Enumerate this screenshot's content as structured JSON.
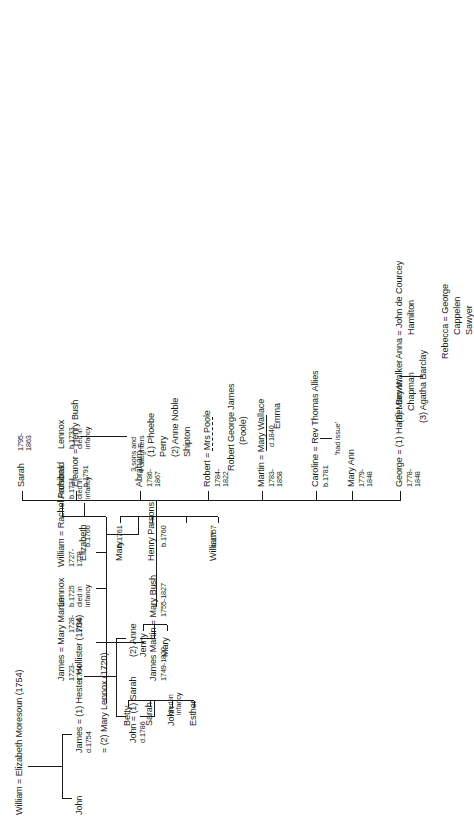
{
  "diagram": {
    "type": "genealogy-family-tree",
    "orientation": "rotated-90-ccw",
    "root": "William = Elizabeth Moresoun (1754)"
  },
  "gen1": {
    "couple": "William = Elizabeth Moresoun (1754)"
  },
  "gen2": {
    "john": "John",
    "james_name": "James = (1) Hester Hollister (1704)",
    "james_dates": "d.1754",
    "james_m2": "= (2) Mary Lennox (1720)"
  },
  "gen3_hester": {
    "john_name": "John = (1) Sarah",
    "john_dates": "d.1786",
    "anne": "(2) Anne",
    "anne_children": [
      "Mary",
      "Jenny"
    ],
    "john_children": [
      "Esther",
      "John",
      "Sarah",
      "Betty"
    ],
    "john_infancy": "died in\ninfancy"
  },
  "gen3_lennox": {
    "james_name": "James = Mary Martin",
    "james_dates": "1723-\n1764",
    "mary_martin_dates": "1728-\n1796",
    "lennox": "Lennox",
    "lennox_dates": "b.1725\ndied in\ninfancy",
    "william_name": "William = Rachel Parsons",
    "william_dates": "1727-\n1778",
    "archibald": "Archibald",
    "archibald_dates": "b.1731\ndied in\ninfancy",
    "lennox2": "Lennox",
    "lennox2_dates": "b.1733\ndied in\ninfancy"
  },
  "gen4_william": {
    "children": [
      {
        "name": "William",
        "dates": "b.1757"
      },
      {
        "name": "Henry Parsons",
        "dates": "b.1760"
      },
      {
        "name": "Mary",
        "dates": "b.1761"
      },
      {
        "name": "Elizabeth",
        "dates": "b.1766"
      }
    ]
  },
  "gen4_james": {
    "name": "James Martin = Mary Bush",
    "dates_husband": "1749-1822",
    "dates_wife": "1755-1827"
  },
  "gen5": {
    "george": {
      "name": "George = (1) Harriet Brown",
      "m2": "(2) Mary Walker",
      "m2b": "Chapman",
      "m3": "(3) Agatha Barclay",
      "dates": "1778-\n1848"
    },
    "mary_ann": {
      "name": "Mary Ann",
      "dates": "1779-\n1848"
    },
    "caroline": {
      "name": "Caroline = Rev Thomas Allies",
      "dates": "b.1781",
      "issue": "'had issue'"
    },
    "martin": {
      "name": "Martin = Mary Wallace",
      "dates": "1783-\n1858",
      "wife_dates": "d.1840",
      "child": "Emma"
    },
    "robert": {
      "name": "Robert = Mrs Poole",
      "dates": "1784-\n1822",
      "child": "Robert George James",
      "child_surname": "(Poole)"
    },
    "abraham": {
      "name": "Abraham =",
      "dates": "1786-\n1867",
      "m1": "(1) Phoebe",
      "m1b": "Perry",
      "m2": "(2) Anne Noble",
      "m2b": "Shipton"
    },
    "eleanor": {
      "name": "Eleanor = Henry Bush",
      "dates": "b.1791",
      "issue": "3 sons and\n4 daughters"
    },
    "sarah": {
      "name": "Sarah",
      "dates": "1795-\n1863"
    }
  },
  "gen6_george": {
    "anna": "Anna = John de Courcey",
    "anna_b": "Hamilton",
    "rebecca": "Rebecca = George",
    "rebecca_b": "Cappelen",
    "rebecca_c": "Sawyer"
  }
}
